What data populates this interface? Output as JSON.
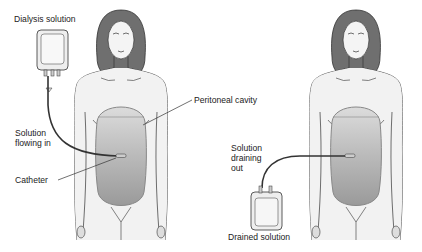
{
  "diagram": {
    "panels": [
      {
        "id": "fill",
        "labels": {
          "dialysis_solution": "Dialysis solution",
          "peritoneal_cavity": "Peritoneal cavity",
          "solution_flowing_in": "Solution\nflowing in",
          "catheter": "Catheter"
        }
      },
      {
        "id": "drain",
        "labels": {
          "solution_draining_out": "Solution\ndraining\nout",
          "drained_solution": "Drained solution"
        }
      }
    ],
    "colors": {
      "hair": "#6f6f6f",
      "skin": "#f2f2f2",
      "outline": "#333333",
      "cavity_fill": "#a9a9a9",
      "cavity_top": "#d6d6d6",
      "bag": "#eeeeee"
    }
  }
}
